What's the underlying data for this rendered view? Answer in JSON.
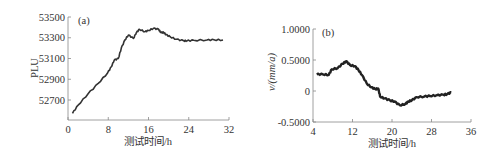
{
  "chart_data": [
    {
      "type": "line",
      "panel_label": "(a)",
      "title": "",
      "xlabel": "测试时间/h",
      "ylabel": "PLU",
      "xlim": [
        0,
        32
      ],
      "ylim": [
        52560,
        53500
      ],
      "xticks": [
        0,
        8,
        16,
        24,
        32
      ],
      "xtick_labels": [
        "0",
        "8",
        "16",
        "24",
        "32"
      ],
      "yticks": [
        52700,
        52900,
        53100,
        53300,
        53500
      ],
      "ytick_labels": [
        "52700",
        "52900",
        "53100",
        "53300",
        "53500"
      ],
      "grid": false,
      "series": [
        {
          "name": "PLU",
          "x": [
            0.9,
            2,
            4,
            6,
            7.9,
            8.6,
            9.2,
            10,
            10.6,
            11.3,
            12,
            13,
            13.6,
            14.2,
            15.3,
            16,
            17,
            18,
            18.5,
            19,
            19.5,
            20.3,
            21.5,
            23,
            23.6,
            25,
            27.6,
            29,
            30.8
          ],
          "y": [
            52572,
            52650,
            52760,
            52860,
            52963,
            53020,
            53085,
            53100,
            53200,
            53278,
            53326,
            53294,
            53350,
            53381,
            53358,
            53370,
            53391,
            53381,
            53350,
            53352,
            53330,
            53310,
            53285,
            53272,
            53270,
            53275,
            53278,
            53280,
            53278
          ]
        }
      ]
    },
    {
      "type": "line",
      "panel_label": "(b)",
      "title": "",
      "xlabel": "测试时间/h",
      "ylabel": "v/(mm/a)",
      "xlim": [
        4,
        36
      ],
      "ylim": [
        -0.5,
        1.0
      ],
      "xticks": [
        4,
        12,
        20,
        28,
        36
      ],
      "xtick_labels": [
        "4",
        "12",
        "20",
        "28",
        "36"
      ],
      "yticks": [
        -0.5,
        0,
        0.5,
        1.0
      ],
      "ytick_labels": [
        "-0.5000",
        "0",
        "0.5000",
        "1.0000"
      ],
      "grid": false,
      "series": [
        {
          "name": "v",
          "x": [
            4.75,
            6,
            7.2,
            7.8,
            9,
            10,
            10.7,
            11.5,
            12.5,
            13.2,
            13.9,
            14.9,
            15.8,
            16.6,
            17.2,
            17.6,
            18.5,
            19.6,
            20.5,
            21.6,
            22.7,
            23.3,
            24,
            25,
            26.5,
            27.7,
            29,
            30.4,
            31.2,
            32
          ],
          "y": [
            0.27,
            0.27,
            0.26,
            0.35,
            0.37,
            0.44,
            0.48,
            0.42,
            0.4,
            0.34,
            0.26,
            0.12,
            0.06,
            0.03,
            0.04,
            -0.09,
            -0.12,
            -0.15,
            -0.17,
            -0.23,
            -0.21,
            -0.17,
            -0.15,
            -0.1,
            -0.09,
            -0.08,
            -0.07,
            -0.06,
            -0.05,
            -0.02
          ]
        }
      ]
    }
  ]
}
